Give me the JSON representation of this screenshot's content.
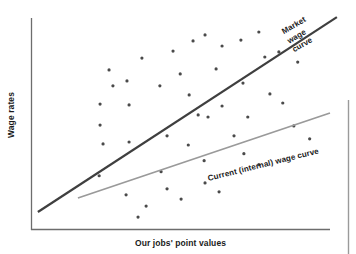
{
  "chart_data": {
    "type": "scatter",
    "title": "",
    "xlabel": "Our jobs' point values",
    "ylabel": "Wage rates",
    "grid": false,
    "legend_position": "inline-annotation",
    "axis_style": {
      "x_axis_color": "#6d6d6d",
      "y_axis_color": "#6d6d6d",
      "show_ticks": false,
      "show_tick_labels": false
    },
    "xlim": [
      0,
      100
    ],
    "ylim": [
      0,
      100
    ],
    "point_color": "#4a4a4a",
    "point_size_px": 3.2,
    "points": [
      {
        "x": 26.1,
        "y": 75.5
      },
      {
        "x": 27.4,
        "y": 68.0
      },
      {
        "x": 32.1,
        "y": 70.3
      },
      {
        "x": 37.1,
        "y": 81.1
      },
      {
        "x": 47.5,
        "y": 84.4
      },
      {
        "x": 43.1,
        "y": 68.0
      },
      {
        "x": 32.8,
        "y": 59.0
      },
      {
        "x": 23.1,
        "y": 59.4
      },
      {
        "x": 23.1,
        "y": 49.5
      },
      {
        "x": 54.2,
        "y": 89.2
      },
      {
        "x": 58.2,
        "y": 92.0
      },
      {
        "x": 63.9,
        "y": 86.8
      },
      {
        "x": 70.2,
        "y": 89.6
      },
      {
        "x": 76.2,
        "y": 93.4
      },
      {
        "x": 78.2,
        "y": 81.6
      },
      {
        "x": 82.9,
        "y": 84.0
      },
      {
        "x": 89.2,
        "y": 79.2
      },
      {
        "x": 49.9,
        "y": 73.6
      },
      {
        "x": 61.9,
        "y": 76.0
      },
      {
        "x": 70.9,
        "y": 69.3
      },
      {
        "x": 52.9,
        "y": 63.7
      },
      {
        "x": 63.9,
        "y": 58.5
      },
      {
        "x": 79.9,
        "y": 64.2
      },
      {
        "x": 84.2,
        "y": 59.9
      },
      {
        "x": 55.9,
        "y": 54.3
      },
      {
        "x": 59.2,
        "y": 53.3
      },
      {
        "x": 72.5,
        "y": 53.3
      },
      {
        "x": 24.1,
        "y": 40.6
      },
      {
        "x": 32.8,
        "y": 41.5
      },
      {
        "x": 45.5,
        "y": 44.4
      },
      {
        "x": 52.6,
        "y": 40.1
      },
      {
        "x": 67.9,
        "y": 44.4
      },
      {
        "x": 87.9,
        "y": 49.1
      },
      {
        "x": 93.2,
        "y": 43.0
      },
      {
        "x": 22.8,
        "y": 25.6
      },
      {
        "x": 43.5,
        "y": 27.5
      },
      {
        "x": 57.9,
        "y": 32.7
      },
      {
        "x": 71.2,
        "y": 36.0
      },
      {
        "x": 76.2,
        "y": 30.8
      },
      {
        "x": 31.8,
        "y": 16.6
      },
      {
        "x": 45.5,
        "y": 19.4
      },
      {
        "x": 58.2,
        "y": 22.2
      },
      {
        "x": 38.5,
        "y": 11.3
      },
      {
        "x": 50.2,
        "y": 14.6
      },
      {
        "x": 62.9,
        "y": 18.0
      },
      {
        "x": 35.8,
        "y": 6.1
      }
    ],
    "lines": [
      {
        "name": "Market wage curve",
        "label": "Market wage curve",
        "label_lines": [
          "Market",
          "wage",
          "curve"
        ],
        "color": "#3f3f3f",
        "width_px": 2.2,
        "x0": 2.3,
        "y0": 8.5,
        "x1": 102.3,
        "y1": 100.4
      },
      {
        "name": "Current (internal) wage curve",
        "label": "Current (internal) wage curve",
        "label_lines": [
          "Current (internal) wage curve"
        ],
        "color": "#9a9a9a",
        "width_px": 1.8,
        "x0": 15.7,
        "y0": 15.1,
        "x1": 100.0,
        "y1": 55.2
      }
    ]
  },
  "labels": {
    "y_axis_title": "Wage rates",
    "x_axis_title": "Our jobs' point values",
    "market_curve_line1": "Market",
    "market_curve_line2": "wage",
    "market_curve_line3": "curve",
    "internal_curve": "Current (internal) wage curve"
  },
  "colors": {
    "point": "#4a4a4a",
    "market_line": "#3f3f3f",
    "internal_line": "#9a9a9a",
    "axis": "#6d6d6d",
    "margin_rule": "#9a9a9a",
    "text": "#1b1b1b",
    "background": "#ffffff"
  }
}
